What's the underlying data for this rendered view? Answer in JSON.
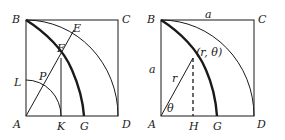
{
  "figure": {
    "left_panel": {
      "labels": {
        "B": "B",
        "C": "C",
        "E": "E",
        "F": "F",
        "L": "L",
        "P": "P",
        "A": "A",
        "K": "K",
        "G": "G",
        "D": "D"
      }
    },
    "right_panel": {
      "labels": {
        "B": "B",
        "a_top": "a",
        "C": "C",
        "point": "(r, θ)",
        "a_side": "a",
        "r": "r",
        "theta": "θ",
        "A": "A",
        "H": "H",
        "G": "G",
        "D": "D"
      }
    },
    "colors": {
      "ink": "#1a1a1a",
      "background": "#ffffff"
    }
  }
}
